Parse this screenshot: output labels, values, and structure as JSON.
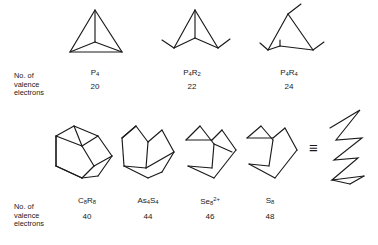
{
  "figure": {
    "type": "chemical-structure-diagram",
    "background_color": "#ffffff",
    "line_color": "#1a1a1a",
    "row_label_text_line1": "No. of",
    "row_label_text_line2": "valence",
    "row_label_text_line3": "electrons",
    "equivalence_symbol": "≡"
  },
  "rows": [
    {
      "row_label": [
        "No. of",
        "valence",
        "electrons"
      ],
      "molecules": [
        {
          "formula_html": "P<sub>4</sub>",
          "formula_plain": "P4",
          "valence_electrons": "20",
          "shape": "tetrahedron"
        },
        {
          "formula_html": "P<sub>4</sub>R<sub>2</sub>",
          "formula_plain": "P4R2",
          "valence_electrons": "22",
          "shape": "opened-tetrahedron-butterfly-2R"
        },
        {
          "formula_html": "P<sub>4</sub>R<sub>4</sub>",
          "formula_plain": "P4R4",
          "valence_electrons": "24",
          "shape": "opened-ring-4R"
        }
      ]
    },
    {
      "row_label": [
        "No. of",
        "valence",
        "electrons"
      ],
      "molecules": [
        {
          "formula_html": "C<sub>8</sub>R<sub>8</sub>",
          "formula_plain": "C8R8",
          "valence_electrons": "40",
          "shape": "cubane"
        },
        {
          "formula_html": "As<sub>4</sub>S<sub>4</sub>",
          "formula_plain": "As4S4",
          "valence_electrons": "44",
          "shape": "cube-one-edge-opened"
        },
        {
          "formula_html": "Se<sub>8</sub><sup>2+</sup>",
          "formula_plain": "Se8 2+",
          "valence_electrons": "46",
          "shape": "cube-two-edges-opened"
        },
        {
          "formula_html": "S<sub>8</sub>",
          "formula_plain": "S8",
          "valence_electrons": "48",
          "shape": "eight-membered-crown-ring"
        }
      ],
      "equivalent_form": {
        "symbol": "≡",
        "shape": "crown-zigzag-side-view",
        "refers_to": "S8"
      }
    }
  ],
  "chart_data": {
    "type": "table",
    "title": "",
    "columns": [
      "formula",
      "valence_electrons"
    ],
    "rows": [
      [
        "P4",
        20
      ],
      [
        "P4R2",
        22
      ],
      [
        "P4R4",
        24
      ],
      [
        "C8R8",
        40
      ],
      [
        "As4S4",
        44
      ],
      [
        "Se8 2+",
        46
      ],
      [
        "S8",
        48
      ]
    ]
  }
}
